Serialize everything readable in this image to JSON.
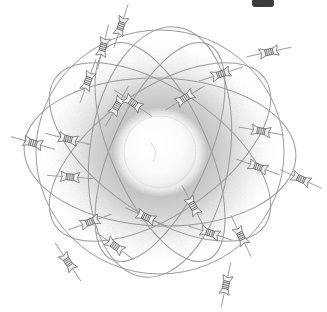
{
  "figure": {
    "kind": "atom-model-illustration",
    "medium": "pencil / stipple engraving",
    "title_partial": "",
    "background_color": "#ffffff",
    "width": 327,
    "height": 312
  },
  "nucleus": {
    "label": "nucleus",
    "center_x": 160,
    "center_y": 152,
    "radius": 36,
    "fill_color": "#fcfcfc",
    "edge_color": "#d8d8d8"
  },
  "electron_cloud": {
    "label": "electron cloud",
    "center_x": 160,
    "center_y": 152,
    "radius_x": 118,
    "radius_y": 112,
    "inner_color": "#ffffff",
    "mid_color": "#cdcdcd",
    "outer_color": "#ffffff",
    "stipple_color": "#9d9d9d"
  },
  "orbits": {
    "stroke_color": "#9a9a9a",
    "stroke_width": 1.0,
    "count": 7,
    "list": [
      {
        "name": "orbit-outer-sphere",
        "rx": 124,
        "ry": 122,
        "rotation": 0
      },
      {
        "name": "orbit-horizontal-wide",
        "rx": 136,
        "ry": 74,
        "rotation": 2
      },
      {
        "name": "orbit-tilted-right",
        "rx": 128,
        "ry": 62,
        "rotation": 35
      },
      {
        "name": "orbit-tilted-left",
        "rx": 128,
        "ry": 62,
        "rotation": -35
      },
      {
        "name": "orbit-steep-right",
        "rx": 118,
        "ry": 48,
        "rotation": 66
      },
      {
        "name": "orbit-steep-left",
        "rx": 118,
        "ry": 48,
        "rotation": -66
      },
      {
        "name": "orbit-vertical-narrow",
        "rx": 70,
        "ry": 126,
        "rotation": 8
      }
    ]
  },
  "electrons": {
    "label": "electron",
    "count": 22,
    "body_color": "#efefef",
    "outline_color": "#6f6f6f",
    "rib_color": "#5d5d5d",
    "needle_color": "#8a8a8a",
    "list": [
      {
        "id": 1,
        "x": 121,
        "y": 26,
        "angle": -72
      },
      {
        "id": 2,
        "x": 103,
        "y": 47,
        "angle": -76
      },
      {
        "id": 3,
        "x": 88,
        "y": 81,
        "angle": -70
      },
      {
        "id": 4,
        "x": 117,
        "y": 106,
        "angle": -60
      },
      {
        "id": 5,
        "x": 133,
        "y": 103,
        "angle": 35
      },
      {
        "id": 6,
        "x": 185,
        "y": 98,
        "angle": -32
      },
      {
        "id": 7,
        "x": 221,
        "y": 74,
        "angle": -18
      },
      {
        "id": 8,
        "x": 269,
        "y": 52,
        "angle": -12
      },
      {
        "id": 9,
        "x": 261,
        "y": 131,
        "angle": 10
      },
      {
        "id": 10,
        "x": 258,
        "y": 167,
        "angle": 20
      },
      {
        "id": 11,
        "x": 301,
        "y": 179,
        "angle": 24
      },
      {
        "id": 12,
        "x": 33,
        "y": 143,
        "angle": 16
      },
      {
        "id": 13,
        "x": 68,
        "y": 139,
        "angle": 14
      },
      {
        "id": 14,
        "x": 70,
        "y": 177,
        "angle": 4
      },
      {
        "id": 15,
        "x": 90,
        "y": 222,
        "angle": -20
      },
      {
        "id": 16,
        "x": 146,
        "y": 217,
        "angle": 24
      },
      {
        "id": 17,
        "x": 193,
        "y": 206,
        "angle": 62
      },
      {
        "id": 18,
        "x": 210,
        "y": 233,
        "angle": 18
      },
      {
        "id": 19,
        "x": 241,
        "y": 236,
        "angle": 64
      },
      {
        "id": 20,
        "x": 115,
        "y": 246,
        "angle": 36
      },
      {
        "id": 21,
        "x": 68,
        "y": 262,
        "angle": 56
      },
      {
        "id": 22,
        "x": 226,
        "y": 285,
        "angle": -78
      }
    ]
  }
}
